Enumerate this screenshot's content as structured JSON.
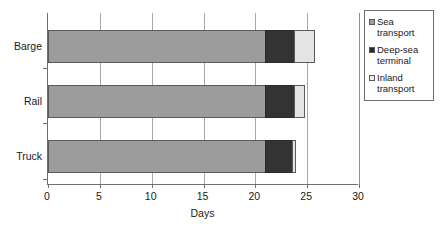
{
  "chart_data": {
    "type": "bar",
    "orientation": "horizontal",
    "stacked": true,
    "title": "",
    "xlabel": "Days",
    "ylabel": "",
    "xlim": [
      0,
      30
    ],
    "xticks": [
      0,
      5,
      10,
      15,
      20,
      25,
      30
    ],
    "grid": "vertical",
    "legend_position": "right",
    "categories": [
      "Barge",
      "Rail",
      "Truck"
    ],
    "series": [
      {
        "name": "Sea transport",
        "color": "#9c9c9c",
        "values": [
          21,
          21,
          21
        ]
      },
      {
        "name": "Deep-sea terminal",
        "color": "#333333",
        "values": [
          3,
          3,
          2.8
        ]
      },
      {
        "name": "Inland transport",
        "color": "#e4e4e4",
        "values": [
          2,
          1,
          0.4
        ]
      }
    ],
    "totals": [
      26,
      25,
      24.2
    ]
  },
  "axis": {
    "x_title": "Days",
    "tick_labels": [
      "0",
      "5",
      "10",
      "15",
      "20",
      "25",
      "30"
    ],
    "category_labels": [
      "Barge",
      "Rail",
      "Truck"
    ]
  },
  "legend": {
    "entries": [
      {
        "label": "Sea transport",
        "swatch": "sea-transport-swatch"
      },
      {
        "label": "Deep-sea terminal",
        "swatch": "deep-sea-terminal-swatch"
      },
      {
        "label": "Inland transport",
        "swatch": "inland-transport-swatch"
      }
    ]
  }
}
